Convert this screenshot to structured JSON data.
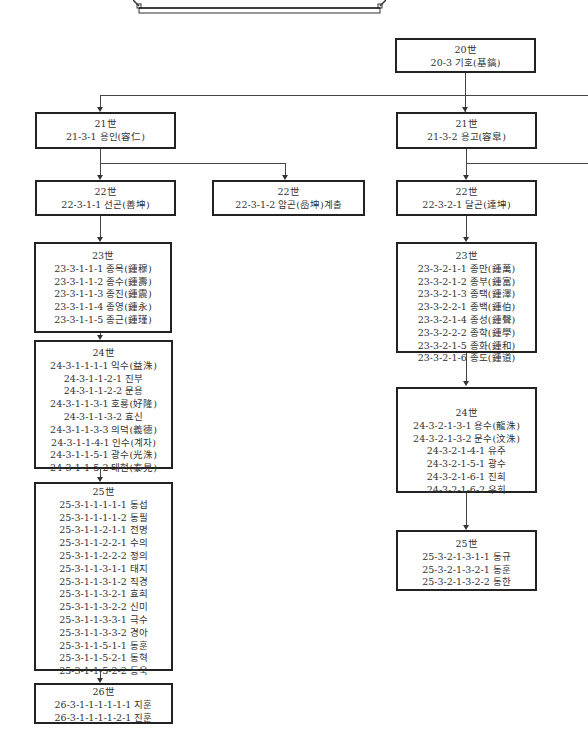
{
  "header": {
    "title": ""
  },
  "nodes": {
    "g20": {
      "gen": "20世",
      "lines": [
        "20-3 기호(基鎬)"
      ]
    },
    "g21_left": {
      "gen": "21世",
      "lines": [
        "21-3-1 용인(容仁)"
      ]
    },
    "g21_right": {
      "gen": "21世",
      "lines": [
        "21-3-2 용고(容皐)"
      ]
    },
    "g22_left": {
      "gen": "22世",
      "lines": [
        "22-3-1-1 선곤(善坤)"
      ]
    },
    "g22_mid": {
      "gen": "22世",
      "lines": [
        "22-3-1-2  암곤(嵒坤)계출"
      ]
    },
    "g22_right": {
      "gen": "22世",
      "lines": [
        "22-3-2-1 달곤(達坤)"
      ]
    },
    "g23_left": {
      "gen": "23世",
      "lines": [
        "23-3-1-1-1 종목(鍾穆)",
        "23-3-1-1-2 종수(鍾壽)",
        "23-3-1-1-3 종진(鍾震)",
        "23-3-1-1-4 종영(鍾永)",
        "23-3-1-1-5 종근(鍾瑾)"
      ]
    },
    "g23_right": {
      "gen": "23世",
      "lines": [
        "23-3-2-1-1 종만(鍾萬)",
        "23-3-2-1-2 종부(鍾富)",
        "23-3-2-1-3 종택(鍾澤)",
        "23-3-2-2-1 종백(鍾伯)",
        "23-3-2-1-4 종성(鍾聲)",
        "23-3-2-2-2 종학(鍾學)",
        "23-3-2-1-5 종화(鍾和)",
        "23-3-2-1-6 종도(鍾道)"
      ]
    },
    "g24_left": {
      "gen": "24世",
      "lines": [
        "24-3-1-1-1-1 익수(益洙)",
        "24-3-1-1-2-1 진부",
        "24-3-1-1-2-2 문용",
        "24-3-1-1-3-1 호룡(好隆)",
        "24-3-1-1-3-2 효신",
        "24-3-1-1-3-3 의덕(義德)",
        "24-3-1-1-4-1 인수(계자)",
        "24-3-1-1-5-1 광수(光洙)",
        "24-3-1-1-5-2 태현(泰見)"
      ]
    },
    "g24_right": {
      "gen": "24世",
      "lines": [
        "24-3-2-1-3-1 용수(龍洙)",
        "24-3-2-1-3-2 문수(汶洙)",
        "24-3-2-1-4-1 유주",
        "24-3-2-1-5-1 광수",
        "24-3-2-1-6-1 진희",
        "24-3-2-1-6-2 우희"
      ]
    },
    "g25_left": {
      "gen": "25世",
      "lines": [
        "25-3-1-1-1-1-1 동섭",
        "25-3-1-1-1-1-2 동필",
        "25-3-1-1-2-1-1 전명",
        "25-3-1-1-2-2-1 수의",
        "25-3-1-1-2-2-2 정의",
        "25-3-1-1-3-1-1 태지",
        "25-3-1-1-3-1-2 직경",
        "25-3-1-1-3-2-1 효희",
        "25-3-1-1-3-2-2 신미",
        "25-3-1-1-3-3-1 극수",
        "25-3-1-1-3-3-2 경아",
        "25-3-1-1-5-1-1 동훈",
        "25-3-1-1-5-2-1 동혁",
        "25-3-1-1-5-2-2 동욱"
      ]
    },
    "g25_right": {
      "gen": "25世",
      "lines": [
        "25-3-2-1-3-1-1 동규",
        "25-3-2-1-3-2-1 동훈",
        "25-3-2-1-3-2-2 동한"
      ]
    },
    "g26_left": {
      "gen": "26世",
      "lines": [
        "26-3-1-1-1-1-1-1 지훈",
        "26-3-1-1-1-1-2-1 진훈"
      ]
    }
  }
}
